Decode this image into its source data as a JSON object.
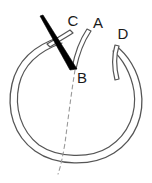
{
  "figure": {
    "background_color": "#ffffff",
    "width": 152,
    "height": 183,
    "stroke_color": "#555555",
    "wedge_color": "#000000",
    "dash_color": "#999999",
    "tube_fill": "#ffffff",
    "labels": [
      {
        "id": "C",
        "text": "C",
        "x": 73,
        "y": 22
      },
      {
        "id": "A",
        "text": "A",
        "x": 98,
        "y": 24
      },
      {
        "id": "D",
        "text": "D",
        "x": 123,
        "y": 35
      },
      {
        "id": "B",
        "text": "B",
        "x": 82,
        "y": 79
      }
    ],
    "parts": {
      "main_loop": {
        "name": "main-loop-tube",
        "description": "Large open tubular loop drawn as a double outline"
      },
      "branch_c": {
        "name": "branch-tube-c",
        "description": "Narrow tube running diagonally up-right toward label C"
      },
      "branch_a": {
        "name": "branch-tube-a",
        "description": "Narrow tube curving down from label A to point B"
      },
      "branch_d": {
        "name": "branch-tube-d",
        "description": "Narrow tube descending from label D into the loop"
      },
      "wedge": {
        "name": "black-wedge",
        "description": "Solid black tapered wedge pointing down-right to point B"
      },
      "dashed_axis": {
        "name": "dashed-reference-line",
        "description": "Dashed curved reference line from point B through the bottom of the loop"
      }
    }
  }
}
